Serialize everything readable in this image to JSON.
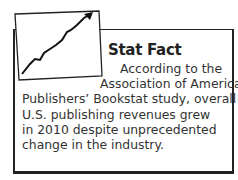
{
  "sidebar_box": {
    "title": "Stat Fact",
    "icon": "rising-line-chart-icon",
    "lines": [
      "According to the",
      "Association of American",
      "Publishers’ Bookstat study, overall",
      "U.S. publishing revenues grew",
      "in 2010 despite unprecedented",
      "change in the industry."
    ]
  }
}
